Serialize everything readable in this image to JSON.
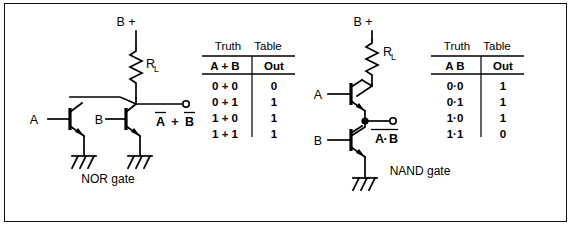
{
  "figure": {
    "background_color": "#ffffff",
    "ink_color": "#000000",
    "border": true
  },
  "circuits": [
    {
      "id": "nor",
      "caption": "NOR gate",
      "supply_label": "B +",
      "resistor_label": "R",
      "resistor_subscript": "L",
      "input_labels": [
        "A",
        "B"
      ],
      "output_label": {
        "left": "A",
        "operator": "+",
        "right": "B",
        "overbar": "both"
      },
      "topology": "two NPN transistors in parallel, common collector load resistor",
      "transistor_count": 2,
      "ground_symbols": 2
    },
    {
      "id": "nand",
      "caption": "NAND gate",
      "supply_label": "B +",
      "resistor_label": "R",
      "resistor_subscript": "L",
      "input_labels": [
        "A",
        "B"
      ],
      "output_label": {
        "left": "A",
        "operator": "·",
        "right": "B",
        "overbar": "whole"
      },
      "topology": "two NPN transistors in series, output tapped between them",
      "transistor_count": 2,
      "ground_symbols": 1
    }
  ],
  "tables": [
    {
      "id": "nor-truth-table",
      "title_words": [
        "Truth",
        "Table"
      ],
      "columns": [
        "A + B",
        "Out"
      ],
      "rows": [
        {
          "inputs": "0 + 0",
          "out": "0"
        },
        {
          "inputs": "0 + 1",
          "out": "1"
        },
        {
          "inputs": "1 + 0",
          "out": "1"
        },
        {
          "inputs": "1 + 1",
          "out": "1"
        }
      ]
    },
    {
      "id": "nand-truth-table",
      "title_words": [
        "Truth",
        "Table"
      ],
      "columns": [
        "A  B",
        "Out"
      ],
      "rows": [
        {
          "inputs": "0·0",
          "out": "1"
        },
        {
          "inputs": "0·1",
          "out": "1"
        },
        {
          "inputs": "1·0",
          "out": "1"
        },
        {
          "inputs": "1·1",
          "out": "0"
        }
      ]
    }
  ]
}
